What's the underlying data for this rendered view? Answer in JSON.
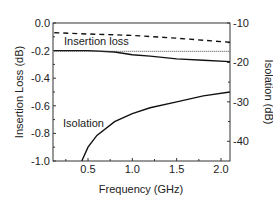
{
  "chart_data": {
    "type": "line",
    "title": "",
    "xlabel": "Frequency (GHz)",
    "ylabel": "Insertion Loss (dB)",
    "y2label": "Isolation (dB)",
    "xlim": [
      0.12,
      2.1
    ],
    "ylim": [
      -1.0,
      0.0
    ],
    "y2lim": [
      -45,
      -10
    ],
    "xticks": [
      "0.5",
      "1.0",
      "1.5",
      "2.0"
    ],
    "yticks": [
      "0.0",
      "-0.2",
      "-0.4",
      "-0.6",
      "-0.8",
      "-1.0"
    ],
    "y2ticks": [
      "-10",
      "-20",
      "-30",
      "-40"
    ],
    "grid": false,
    "annotations": [
      "Insertion loss",
      "Isolation"
    ],
    "series": [
      {
        "name": "Insertion loss (solid)",
        "axis": "left",
        "style": "solid",
        "x": [
          0.12,
          0.5,
          0.8,
          1.0,
          1.2,
          1.5,
          1.8,
          2.1
        ],
        "y": [
          -0.2,
          -0.2,
          -0.21,
          -0.23,
          -0.24,
          -0.26,
          -0.27,
          -0.28
        ]
      },
      {
        "name": "Insertion loss (dashed)",
        "axis": "left",
        "style": "dashed",
        "x": [
          0.12,
          0.5,
          1.0,
          1.5,
          2.1
        ],
        "y": [
          -0.07,
          -0.08,
          -0.09,
          -0.11,
          -0.14
        ]
      },
      {
        "name": "Reference (dotted)",
        "axis": "left",
        "style": "dotted",
        "x": [
          0.12,
          2.1
        ],
        "y": [
          -0.205,
          -0.205
        ]
      },
      {
        "name": "Isolation",
        "axis": "right",
        "style": "solid",
        "x": [
          0.43,
          0.5,
          0.6,
          0.8,
          1.0,
          1.2,
          1.5,
          1.8,
          2.1
        ],
        "y": [
          -45,
          -41.5,
          -38.5,
          -35,
          -33,
          -31.5,
          -30,
          -28.5,
          -27.5
        ]
      }
    ]
  }
}
